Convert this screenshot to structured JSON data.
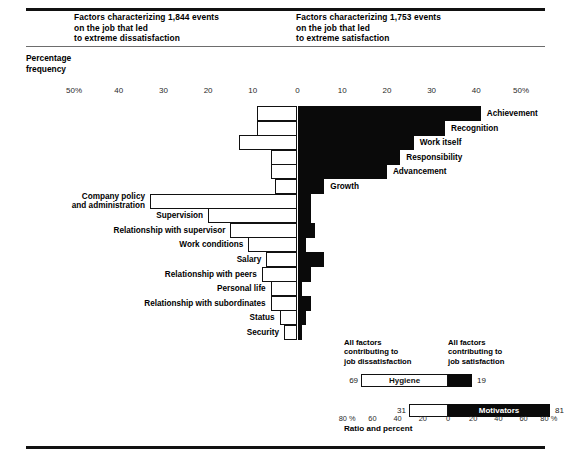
{
  "header": {
    "left_title_lines": [
      "Factors characterizing 1,844 events",
      "on the job that led",
      "to extreme dissatisfaction"
    ],
    "right_title_lines": [
      "Factors characterizing 1,753 events",
      "on the job that led",
      "to extreme satisfaction"
    ],
    "y_axis_label_lines": [
      "Percentage",
      "frequency"
    ]
  },
  "chart_data": {
    "type": "bar",
    "orientation": "horizontal",
    "xlabel": "Percentage frequency",
    "ylabel": "",
    "xlim": [
      -50,
      50
    ],
    "grid": false,
    "legend_position": "bottom-right",
    "axis_ticks": [
      {
        "label": "50%",
        "value": -50
      },
      {
        "label": "40",
        "value": -40
      },
      {
        "label": "30",
        "value": -30
      },
      {
        "label": "20",
        "value": -20
      },
      {
        "label": "10",
        "value": -10
      },
      {
        "label": "0",
        "value": 0
      },
      {
        "label": "10",
        "value": 10
      },
      {
        "label": "20",
        "value": 20
      },
      {
        "label": "30",
        "value": 30
      },
      {
        "label": "40",
        "value": 40
      },
      {
        "label": "50%",
        "value": 50
      }
    ],
    "note": "Each factor is drawn as a single bar spanning from a negative (dissatisfaction, drawn hollow/white) extent to a positive (satisfaction, drawn solid/black) extent around the zero line.",
    "series": [
      {
        "name": "dissatisfaction",
        "style": "hollow-white",
        "side": "left"
      },
      {
        "name": "satisfaction",
        "style": "solid-black",
        "side": "right"
      }
    ],
    "categories": [
      {
        "label": "Achievement",
        "group": "motivator",
        "label_side": "right",
        "dissatisfaction": 9,
        "satisfaction": 41
      },
      {
        "label": "Recognition",
        "group": "motivator",
        "label_side": "right",
        "dissatisfaction": 9,
        "satisfaction": 33
      },
      {
        "label": "Work itself",
        "group": "motivator",
        "label_side": "right",
        "dissatisfaction": 13,
        "satisfaction": 26
      },
      {
        "label": "Responsibility",
        "group": "motivator",
        "label_side": "right",
        "dissatisfaction": 6,
        "satisfaction": 23
      },
      {
        "label": "Advancement",
        "group": "motivator",
        "label_side": "right",
        "dissatisfaction": 6,
        "satisfaction": 20
      },
      {
        "label": "Growth",
        "group": "motivator",
        "label_side": "right",
        "dissatisfaction": 5,
        "satisfaction": 6
      },
      {
        "label": "Company policy\nand administration",
        "group": "hygiene",
        "label_side": "left",
        "dissatisfaction": 33,
        "satisfaction": 3
      },
      {
        "label": "Supervision",
        "group": "hygiene",
        "label_side": "left",
        "dissatisfaction": 20,
        "satisfaction": 3
      },
      {
        "label": "Relationship with supervisor",
        "group": "hygiene",
        "label_side": "left",
        "dissatisfaction": 15,
        "satisfaction": 4
      },
      {
        "label": "Work conditions",
        "group": "hygiene",
        "label_side": "left",
        "dissatisfaction": 11,
        "satisfaction": 2
      },
      {
        "label": "Salary",
        "group": "hygiene",
        "label_side": "left",
        "dissatisfaction": 7,
        "satisfaction": 6
      },
      {
        "label": "Relationship with peers",
        "group": "hygiene",
        "label_side": "left",
        "dissatisfaction": 8,
        "satisfaction": 3
      },
      {
        "label": "Personal life",
        "group": "hygiene",
        "label_side": "left",
        "dissatisfaction": 6,
        "satisfaction": 1
      },
      {
        "label": "Relationship with subordinates",
        "group": "hygiene",
        "label_side": "left",
        "dissatisfaction": 6,
        "satisfaction": 3
      },
      {
        "label": "Status",
        "group": "hygiene",
        "label_side": "left",
        "dissatisfaction": 4,
        "satisfaction": 2
      },
      {
        "label": "Security",
        "group": "hygiene",
        "label_side": "left",
        "dissatisfaction": 3,
        "satisfaction": 1
      }
    ],
    "summary": {
      "left_heading_lines": [
        "All factors",
        "contributing to",
        "job dissatisfaction"
      ],
      "right_heading_lines": [
        "All factors",
        "contributing to",
        "job satisfaction"
      ],
      "xlim": [
        -80,
        80
      ],
      "axis_ticks": [
        {
          "label": "80 %",
          "value": -80
        },
        {
          "label": "60",
          "value": -60
        },
        {
          "label": "40",
          "value": -40
        },
        {
          "label": "20",
          "value": -20
        },
        {
          "label": "0",
          "value": 0
        },
        {
          "label": "20",
          "value": 20
        },
        {
          "label": "40",
          "value": 40
        },
        {
          "label": "60",
          "value": 60
        },
        {
          "label": "80 %",
          "value": 80
        }
      ],
      "caption": "Ratio and percent",
      "bars": [
        {
          "name": "Hygiene",
          "dissatisfaction": 69,
          "satisfaction": 19,
          "left_value_label": "69",
          "right_value_label": "19"
        },
        {
          "name": "Motivators",
          "dissatisfaction": 31,
          "satisfaction": 81,
          "left_value_label": "31",
          "right_value_label": "81"
        }
      ]
    }
  },
  "colors": {
    "solid": "#0a0a0a",
    "hollow_fill": "#ffffff",
    "outline": "#111111",
    "rule": "#111111",
    "rule_thin": "#6d6d6d",
    "text": "#000000"
  }
}
